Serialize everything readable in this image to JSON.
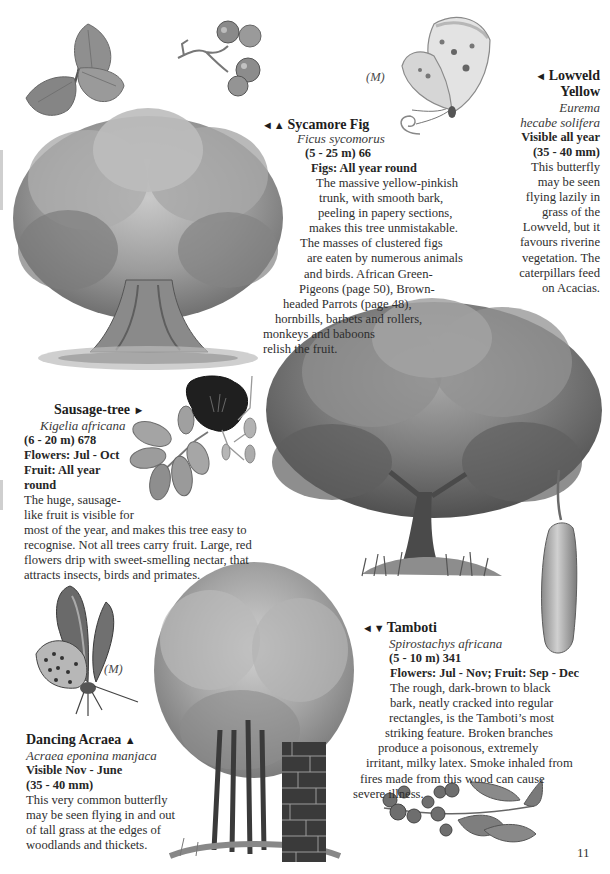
{
  "page_number": "11",
  "sycamore_fig": {
    "icons": "◄ ▲",
    "name": "Sycamore Fig",
    "scientific": "Ficus sycomorus",
    "size": "(5 - 25 m) 66",
    "season": "Figs: All year round",
    "lines": [
      "The massive yellow-pinkish",
      "trunk, with smooth bark,",
      "peeling in papery sections,",
      "makes this tree unmistakable.",
      "The masses of clustered figs",
      "are eaten by numerous animals",
      "and birds. African Green-",
      "Pigeons (page 50), Brown-",
      "headed Parrots (page 48),",
      "hornbills, barbets and rollers,",
      "monkeys and baboons",
      "relish the fruit."
    ]
  },
  "lowveld_yellow": {
    "icon": "◄",
    "name_line1": "Lowveld",
    "name_line2": "Yellow",
    "scientific_line1": "Eurema",
    "scientific_line2": "hecabe solifera",
    "season": "Visible all year",
    "size": "(35 - 40 mm)",
    "marker": "(M)",
    "lines": [
      "This butterfly",
      "may be seen",
      "flying lazily in",
      "grass of the",
      "Lowveld, but it",
      "favours riverine",
      "vegetation. The",
      "caterpillars feed",
      "on Acacias."
    ]
  },
  "sausage_tree": {
    "icon": "►",
    "name": "Sausage-tree",
    "scientific": "Kigelia africana",
    "size": "(6 - 20 m) 678",
    "flowers": "Flowers: Jul - Oct",
    "fruit_line1": "Fruit: All year",
    "fruit_line2": "round",
    "lines": [
      "The huge, sausage-",
      "like fruit is visible for",
      "most of the year, and makes this tree easy to",
      "recognise. Not all trees carry fruit. Large, red",
      "flowers drip with sweet-smelling nectar, that",
      "attracts insects, birds and primates."
    ]
  },
  "tamboti": {
    "icons": "◄ ▼",
    "name": "Tamboti",
    "scientific": "Spirostachys africana",
    "size": "(5 - 10 m) 341",
    "season": "Flowers: Jul - Nov; Fruit: Sep - Dec",
    "lines": [
      "The rough, dark-brown to black",
      "bark, neatly cracked into regular",
      "rectangles, is the Tamboti’s most",
      "striking feature. Broken branches",
      "produce a poisonous, extremely",
      "irritant, milky latex. Smoke inhaled from",
      "fires made from this wood can cause",
      "severe illness."
    ]
  },
  "dancing_acraea": {
    "icon": "▲",
    "name": "Dancing Acraea",
    "scientific": "Acraea eponina manjaca",
    "season": "Visible Nov - June",
    "size": "(35 - 40 mm)",
    "marker": "(M)",
    "lines": [
      "This very common butterfly",
      "may be seen flying in and out",
      "of tall grass at the edges of",
      "woodlands and thickets."
    ]
  },
  "illustrations": {
    "fig_leaves": "fig-leaves-illustration",
    "fig_fruit": "fig-fruit-cluster-illustration",
    "sycamore_tree": "sycamore-fig-tree-illustration",
    "lowveld_butterfly": "lowveld-yellow-butterfly-illustration",
    "sausage_flower": "sausage-tree-flower-illustration",
    "sausage_tree": "sausage-tree-illustration",
    "sausage_fruit": "sausage-fruit-illustration",
    "acraea_butterfly": "dancing-acraea-butterfly-illustration",
    "tamboti_tree": "tamboti-tree-illustration",
    "tamboti_bark": "tamboti-bark-illustration",
    "tamboti_fruit": "tamboti-fruit-leaves-illustration"
  },
  "colors": {
    "text": "#2e2e2e",
    "illustration_light": "#b8b8b8",
    "illustration_mid": "#8a8a8a",
    "illustration_dark": "#3c3c3c",
    "flower_dark": "#1e1e1e"
  }
}
